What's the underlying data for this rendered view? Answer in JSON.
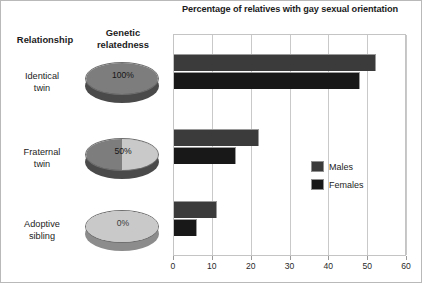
{
  "figure": {
    "border_color": "#b9b9b9",
    "background": "#ffffff"
  },
  "headers": {
    "relationship": "Relationship",
    "relatedness_line1": "Genetic",
    "relatedness_line2": "relatedness"
  },
  "rows": [
    {
      "label_line1": "Identical",
      "label_line2": "twin",
      "relatedness": "100%",
      "disc_class": "disc-100"
    },
    {
      "label_line1": "Fraternal",
      "label_line2": "twin",
      "relatedness": "50%",
      "disc_class": "disc-50"
    },
    {
      "label_line1": "Adoptive",
      "label_line2": "sibling",
      "relatedness": "0%",
      "disc_class": "disc-0"
    }
  ],
  "legend": {
    "position": "middle-right",
    "items": [
      {
        "label": "Males",
        "color": "#3b3b3b"
      },
      {
        "label": "Females",
        "color": "#181818"
      }
    ]
  },
  "chart_data": {
    "type": "bar",
    "orientation": "horizontal",
    "title": "Percentage of relatives with gay sexual orientation",
    "xlabel": "",
    "ylabel": "",
    "categories": [
      "Identical twin",
      "Fraternal twin",
      "Adoptive sibling"
    ],
    "series": [
      {
        "name": "Males",
        "color": "#3b3b3b",
        "values": [
          52,
          22,
          11
        ]
      },
      {
        "name": "Females",
        "color": "#181818",
        "values": [
          48,
          16,
          6
        ]
      }
    ],
    "xlim": [
      0,
      60
    ],
    "xticks": [
      0,
      10,
      20,
      30,
      40,
      50,
      60
    ],
    "xtick_labels": [
      "0",
      "10",
      "20",
      "30",
      "40",
      "50",
      "60"
    ],
    "grid": "vertical",
    "genetic_relatedness": [
      "100%",
      "50%",
      "0%"
    ]
  }
}
